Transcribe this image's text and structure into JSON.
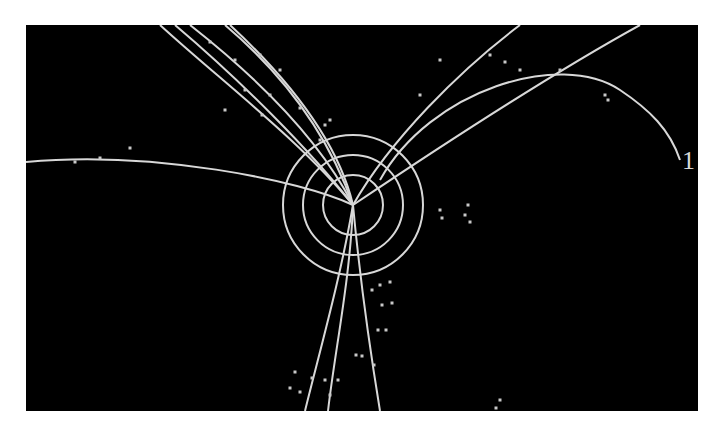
{
  "display": {
    "background": "#000000",
    "track_color": "#d8d8d8",
    "label": "1",
    "vertex": [
      353,
      205
    ],
    "rings": [
      30,
      50,
      70
    ]
  },
  "tracks": [
    "M353,205 C300,180 150,150 26,162",
    "M353,205 C300,140 220,80 160,25",
    "M353,205 C310,150 240,80 175,25",
    "M353,205 C320,140 260,80 190,25",
    "M353,205 C330,140 290,80 225,25",
    "M353,205 C340,150 300,90 230,25",
    "M353,205 C390,140 460,70 520,25",
    "M353,205 C420,160 540,80 640,25",
    "M380,180 C430,90 560,50 620,90 C650,110 670,130 680,160",
    "M353,205 C340,280 320,350 305,411",
    "M353,205 C350,280 335,350 328,411",
    "M353,205 C360,280 370,350 380,411"
  ],
  "hits": [
    [
      75,
      162
    ],
    [
      100,
      158
    ],
    [
      130,
      148
    ],
    [
      210,
      42
    ],
    [
      235,
      60
    ],
    [
      260,
      55
    ],
    [
      245,
      90
    ],
    [
      225,
      110
    ],
    [
      262,
      115
    ],
    [
      280,
      70
    ],
    [
      270,
      95
    ],
    [
      300,
      108
    ],
    [
      325,
      125
    ],
    [
      320,
      140
    ],
    [
      330,
      120
    ],
    [
      420,
      95
    ],
    [
      440,
      60
    ],
    [
      505,
      62
    ],
    [
      520,
      70
    ],
    [
      560,
      70
    ],
    [
      605,
      95
    ],
    [
      608,
      100
    ],
    [
      468,
      205
    ],
    [
      465,
      215
    ],
    [
      470,
      222
    ],
    [
      440,
      210
    ],
    [
      442,
      218
    ],
    [
      372,
      290
    ],
    [
      380,
      285
    ],
    [
      390,
      282
    ],
    [
      382,
      305
    ],
    [
      392,
      303
    ],
    [
      378,
      330
    ],
    [
      386,
      330
    ],
    [
      356,
      355
    ],
    [
      362,
      356
    ],
    [
      374,
      365
    ],
    [
      295,
      372
    ],
    [
      312,
      378
    ],
    [
      325,
      380
    ],
    [
      338,
      380
    ],
    [
      290,
      388
    ],
    [
      300,
      392
    ],
    [
      330,
      395
    ],
    [
      500,
      400
    ],
    [
      496,
      408
    ],
    [
      490,
      55
    ]
  ]
}
